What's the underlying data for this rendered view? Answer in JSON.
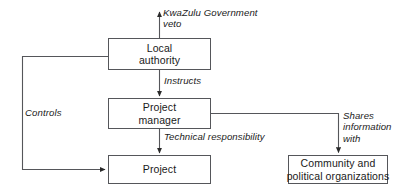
{
  "diagram": {
    "type": "flowchart",
    "background_color": "#ffffff",
    "line_color": "#55565a",
    "text_color": "#1a1a1a",
    "nodes": [
      {
        "id": "local-authority",
        "lines": [
          "Local",
          "authority"
        ],
        "line1": "Local",
        "line2": "authority"
      },
      {
        "id": "project-manager",
        "lines": [
          "Project",
          "manager"
        ],
        "line1": "Project",
        "line2": "manager"
      },
      {
        "id": "project",
        "lines": [
          "Project"
        ],
        "line1": "Project",
        "line2": ""
      },
      {
        "id": "community",
        "lines": [
          "Community and",
          "political organizations"
        ],
        "line1": "Community and",
        "line2": "political organizations"
      }
    ],
    "edges": [
      {
        "id": "veto",
        "from": "local-authority",
        "to": "external-above",
        "label_line1": "KwaZulu Government",
        "label_line2": "veto",
        "direction": "up",
        "arrowhead": true
      },
      {
        "id": "instructs",
        "from": "local-authority",
        "to": "project-manager",
        "label_line1": "Instructs",
        "label_line2": "",
        "direction": "down",
        "arrowhead": true
      },
      {
        "id": "technical-responsibility",
        "from": "project-manager",
        "to": "project",
        "label_line1": "Technical responsibility",
        "label_line2": "",
        "direction": "down",
        "arrowhead": true
      },
      {
        "id": "controls",
        "from": "local-authority",
        "to": "project",
        "label_line1": "Controls",
        "label_line2": "",
        "direction": "left-down-right",
        "arrowhead": true
      },
      {
        "id": "shares-information",
        "from": "project-manager",
        "to": "community",
        "label_line1": "Shares",
        "label_line2": "information",
        "label_line3": "with",
        "direction": "right-down",
        "arrowhead": true
      }
    ]
  }
}
